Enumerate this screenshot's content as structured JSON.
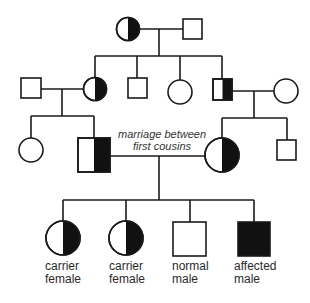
{
  "diagram": {
    "type": "pedigree",
    "generations": [
      {
        "level": 1,
        "individuals": [
          {
            "id": "g1-female",
            "sex": "female",
            "status": "carrier"
          },
          {
            "id": "g1-male",
            "sex": "male",
            "status": "normal"
          }
        ]
      },
      {
        "level": 2,
        "individuals": [
          {
            "id": "g2-spouse-male",
            "sex": "male",
            "status": "normal"
          },
          {
            "id": "g2-female-carrier",
            "sex": "female",
            "status": "carrier"
          },
          {
            "id": "g2-male",
            "sex": "male",
            "status": "normal"
          },
          {
            "id": "g2-female",
            "sex": "female",
            "status": "normal"
          },
          {
            "id": "g2-male-carrier",
            "sex": "male",
            "status": "carrier"
          },
          {
            "id": "g2-spouse-female",
            "sex": "female",
            "status": "normal"
          }
        ]
      },
      {
        "level": 3,
        "individuals": [
          {
            "id": "g3-female-left",
            "sex": "female",
            "status": "normal"
          },
          {
            "id": "g3-male-cousin",
            "sex": "male",
            "status": "carrier"
          },
          {
            "id": "g3-female-cousin",
            "sex": "female",
            "status": "carrier"
          },
          {
            "id": "g3-male-right",
            "sex": "male",
            "status": "normal"
          }
        ]
      },
      {
        "level": 4,
        "individuals": [
          {
            "id": "g4-child-1",
            "sex": "female",
            "status": "carrier"
          },
          {
            "id": "g4-child-2",
            "sex": "female",
            "status": "carrier"
          },
          {
            "id": "g4-child-3",
            "sex": "male",
            "status": "normal"
          },
          {
            "id": "g4-child-4",
            "sex": "male",
            "status": "affected"
          }
        ]
      }
    ],
    "annotation": {
      "line1": "marriage between",
      "line2": "first cousins"
    },
    "labels": [
      {
        "line1": "carrier",
        "line2": "female"
      },
      {
        "line1": "carrier",
        "line2": "female"
      },
      {
        "line1": "normal",
        "line2": "male"
      },
      {
        "line1": "affected",
        "line2": "male"
      }
    ],
    "colors": {
      "stroke": "#1a1a1a",
      "fill_affected": "#111111",
      "background": "#ffffff"
    }
  }
}
